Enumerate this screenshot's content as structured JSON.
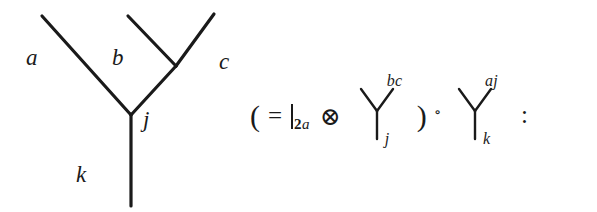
{
  "figure": {
    "background_color": "#ffffff",
    "ink_color": "#1a1a1a",
    "diagram": {
      "type": "trivalent-tree",
      "edge_labels": {
        "a": "a",
        "b": "b",
        "c": "c",
        "j": "j",
        "k": "k"
      }
    },
    "formula": {
      "open_paren": "(",
      "equals": "=",
      "identity_bar_subscript_number": "2",
      "identity_bar_subscript_letter": "a",
      "tensor": "⊗",
      "first_vertex": {
        "superscript": "bc",
        "subscript": "j"
      },
      "close_paren": ")",
      "composition": "∘",
      "second_vertex": {
        "superscript": "aj",
        "subscript": "k"
      },
      "colon": ":"
    }
  }
}
